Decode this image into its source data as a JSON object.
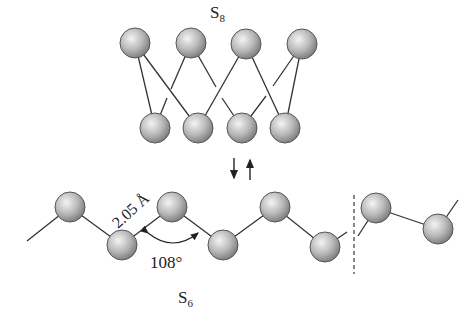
{
  "diagram": {
    "s8": {
      "label": "S",
      "subscript": "8",
      "top_atoms": [
        [
          135,
          43
        ],
        [
          191,
          43
        ],
        [
          246,
          44
        ],
        [
          302,
          44
        ]
      ],
      "bottom_atoms": [
        [
          155,
          128
        ],
        [
          198,
          128
        ],
        [
          242,
          128
        ],
        [
          285,
          128
        ]
      ],
      "bonds": [
        [
          0,
          0
        ],
        [
          0,
          1
        ],
        [
          1,
          0
        ],
        [
          1,
          2
        ],
        [
          2,
          1
        ],
        [
          2,
          3
        ],
        [
          3,
          2
        ],
        [
          3,
          3
        ]
      ]
    },
    "equilibrium_arrows": {
      "down": "↓",
      "up": "↑"
    },
    "s6": {
      "label": "S",
      "subscript": "6",
      "atoms": [
        [
          70,
          207
        ],
        [
          122,
          245
        ],
        [
          172,
          207
        ],
        [
          223,
          245
        ],
        [
          275,
          207
        ],
        [
          325,
          247
        ],
        [
          376,
          208
        ],
        [
          438,
          229
        ]
      ],
      "bond_length_label": "2.05 Å",
      "bond_angle_label": "108°"
    },
    "colors": {
      "atom_light": "#f2f2f2",
      "atom_mid": "#b5b5b5",
      "atom_dark": "#7a7a7a",
      "atom_outline": "#555555",
      "bond": "#333333"
    }
  }
}
